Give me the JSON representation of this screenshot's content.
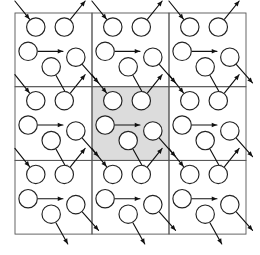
{
  "figure": {
    "background_color": "#ffffff",
    "width": 260,
    "height": 255
  },
  "grid": {
    "rows": 3,
    "cols": 3,
    "origin_x": 15,
    "origin_y": 13,
    "cell_width": 77,
    "cell_height": 73.7,
    "border_color": "#555555",
    "border_width": 0.9,
    "plain_cell_color": "#ffffff",
    "primary_cell_color": "#dcdcdc",
    "primary_cell_row": 1,
    "primary_cell_col": 1,
    "primary_cell_label": "primary-simulation-box",
    "image_cell_label": "periodic-image-box"
  },
  "particles": {
    "count_per_cell": 5,
    "radius": 9.2,
    "fill_color": "#ffffff",
    "stroke_color": "#222222",
    "stroke_width": 1.15,
    "positions": [
      {
        "id": "p1",
        "x": 0.27,
        "y": 0.19
      },
      {
        "id": "p2",
        "x": 0.64,
        "y": 0.19
      },
      {
        "id": "p3",
        "x": 0.17,
        "y": 0.52
      },
      {
        "id": "p4",
        "x": 0.79,
        "y": 0.6
      },
      {
        "id": "p5",
        "x": 0.47,
        "y": 0.73
      }
    ]
  },
  "velocities": {
    "arrow_color": "#111111",
    "arrow_width": 1.15,
    "vectors": [
      {
        "id": "v1",
        "particle": "p1",
        "dx": -0.2,
        "dy": -0.26,
        "direction": "up-left",
        "length": 0.3,
        "points_into_particle": true
      },
      {
        "id": "v2",
        "particle": "p2",
        "dx": 0.2,
        "dy": -0.26,
        "direction": "up-right",
        "length": 0.3,
        "points_into_particle": false
      },
      {
        "id": "v3",
        "particle": "p3",
        "dx": 0.34,
        "dy": 0.0,
        "direction": "right",
        "length": 0.34,
        "points_into_particle": false
      },
      {
        "id": "v4",
        "particle": "p4",
        "dx": 0.22,
        "dy": 0.26,
        "direction": "down-right",
        "length": 0.32,
        "points_into_particle": false
      },
      {
        "id": "v5",
        "particle": "p5",
        "dx": 0.16,
        "dy": 0.3,
        "direction": "down-right",
        "length": 0.32,
        "points_into_particle": false
      }
    ]
  },
  "annotations": {
    "shows_wraparound": true,
    "description": "3 by 3 tiling of identical periodic images around a shaded central cell"
  }
}
